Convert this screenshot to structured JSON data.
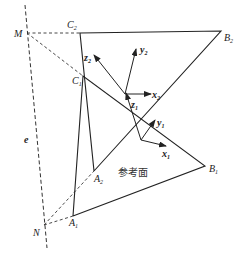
{
  "diagram": {
    "reference_plane_label": "参考面",
    "points": {
      "M": {
        "label": "M",
        "x": 27,
        "y": 33
      },
      "N": {
        "label": "N",
        "x": 44,
        "y": 225
      },
      "A1": {
        "label": "A",
        "sub": "1",
        "x": 73,
        "y": 216
      },
      "A2": {
        "label": "A",
        "sub": "2",
        "x": 94,
        "y": 171
      },
      "B1": {
        "label": "B",
        "sub": "1",
        "x": 205,
        "y": 166
      },
      "B2": {
        "label": "B",
        "sub": "2",
        "x": 221,
        "y": 31
      },
      "C1": {
        "label": "C",
        "sub": "1",
        "x": 83,
        "y": 76
      },
      "C2": {
        "label": "C",
        "sub": "2",
        "x": 80,
        "y": 33
      }
    },
    "axis_line_label": "e",
    "frame2": {
      "origin": [
        125,
        94
      ],
      "x_label": "x",
      "y_label": "y",
      "z_label": "z",
      "sub": "2"
    },
    "frame1": {
      "origin": [
        141,
        140
      ],
      "x_label": "x",
      "y_label": "y",
      "z_label": "z",
      "sub": "1"
    }
  }
}
